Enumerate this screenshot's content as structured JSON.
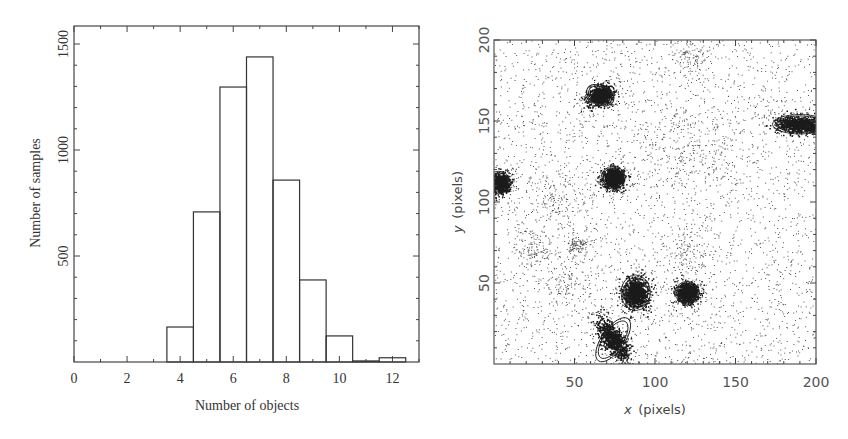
{
  "chart_data": [
    {
      "type": "bar",
      "panel": "left",
      "title": "",
      "xlabel": "Number of objects",
      "ylabel": "Number of samples",
      "xlim": [
        0,
        13
      ],
      "ylim": [
        0,
        1580
      ],
      "xticks": [
        0,
        2,
        4,
        6,
        8,
        10,
        12
      ],
      "yticks": [
        500,
        1000,
        1500
      ],
      "grid": false,
      "categories": [
        4,
        5,
        6,
        7,
        8,
        9,
        10,
        11,
        12
      ],
      "values": [
        165,
        708,
        1297,
        1439,
        858,
        387,
        123,
        5,
        20
      ],
      "bin_width": 1,
      "style": "unfilled outlined histogram bars"
    },
    {
      "type": "scatter",
      "panel": "right",
      "title": "",
      "xlabel": "x (pixels)",
      "ylabel": "y (pixels)",
      "xlim": [
        0,
        200
      ],
      "ylim": [
        0,
        200
      ],
      "xticks": [
        50,
        100,
        150,
        200
      ],
      "yticks": [
        50,
        100,
        150,
        200
      ],
      "grid": false,
      "description": "Density of sampled object positions; dense clusters marked by fitted ellipses",
      "sources": [
        {
          "x": 66,
          "y": 166,
          "rx": 9,
          "ry": 6,
          "angle": -25,
          "label": "ellipse"
        },
        {
          "x": 74,
          "y": 115,
          "rx": 7.5,
          "ry": 7,
          "angle": 0,
          "label": "ellipse"
        },
        {
          "x": 3,
          "y": 112,
          "rx": 7,
          "ry": 7,
          "angle": 0,
          "label": "ellipse"
        },
        {
          "x": 190,
          "y": 148,
          "rx": 17,
          "ry": 6,
          "angle": 0,
          "label": "ellipse"
        },
        {
          "x": 88,
          "y": 44,
          "rx": 9,
          "ry": 11,
          "angle": 0,
          "label": "ellipse"
        },
        {
          "x": 120,
          "y": 44,
          "rx": 7.5,
          "ry": 7,
          "angle": 0,
          "label": "ellipse"
        },
        {
          "x": 74,
          "y": 15,
          "rx": 16,
          "ry": 7,
          "angle": 55,
          "label": "ellipse"
        }
      ],
      "faint_clusters": [
        {
          "x": 122,
          "y": 190,
          "spread": 6
        },
        {
          "x": 25,
          "y": 72,
          "spread": 6
        },
        {
          "x": 52,
          "y": 73,
          "spread": 3
        },
        {
          "x": 120,
          "y": 70,
          "spread": 8
        },
        {
          "x": 110,
          "y": 135,
          "spread": 14
        },
        {
          "x": 135,
          "y": 130,
          "spread": 12
        },
        {
          "x": 38,
          "y": 100,
          "spread": 10
        },
        {
          "x": 45,
          "y": 50,
          "spread": 8
        }
      ]
    }
  ]
}
